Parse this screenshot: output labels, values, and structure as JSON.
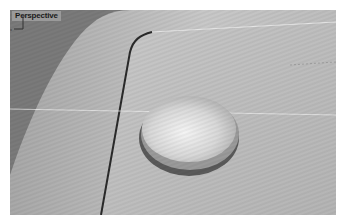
{
  "viewport": {
    "label": "Perspective",
    "background_color": "#7a7a7a",
    "surface_color": "#bdbdbd"
  },
  "axes": {
    "x_label": "x",
    "z_label": "z"
  }
}
